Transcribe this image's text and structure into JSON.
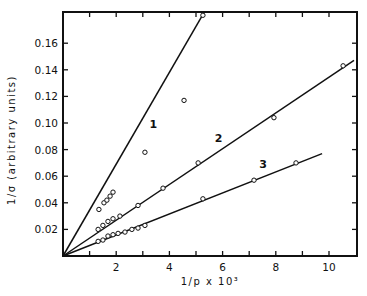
{
  "chart_data": {
    "type": "line",
    "title": "",
    "xlabel": "1/p x 10³",
    "ylabel": "1/σ  (arbitrary units)",
    "xlim": [
      0,
      11.1
    ],
    "ylim": [
      0,
      0.183
    ],
    "xticks": [
      1,
      2,
      3,
      4,
      5,
      6,
      7,
      8,
      9,
      10
    ],
    "xtick_labels": [
      "2",
      "4",
      "6",
      "8",
      "10"
    ],
    "yticks": [
      0.02,
      0.04,
      0.06,
      0.08,
      0.1,
      0.12,
      0.14,
      0.16
    ],
    "ytick_labels": [
      "0.02",
      "0.04",
      "0.06",
      "0.08",
      "0.10",
      "0.12",
      "0.14",
      "0.16"
    ],
    "grid": false,
    "legend": "none; curves labeled inline 1, 2, 3",
    "series": [
      {
        "name": "1",
        "fit_line": {
          "x": [
            0,
            5.3
          ],
          "y": [
            0,
            0.183
          ]
        },
        "points": [
          {
            "x": 1.35,
            "y": 0.035
          },
          {
            "x": 1.54,
            "y": 0.04
          },
          {
            "x": 1.65,
            "y": 0.042
          },
          {
            "x": 1.77,
            "y": 0.045
          },
          {
            "x": 1.88,
            "y": 0.048
          },
          {
            "x": 3.08,
            "y": 0.078
          },
          {
            "x": 4.55,
            "y": 0.117
          },
          {
            "x": 5.26,
            "y": 0.181
          }
        ],
        "label_pos": {
          "x": 3.4,
          "y": 0.096
        }
      },
      {
        "name": "2",
        "fit_line": {
          "x": [
            0,
            10.94
          ],
          "y": [
            0,
            0.147
          ]
        },
        "points": [
          {
            "x": 1.32,
            "y": 0.02
          },
          {
            "x": 1.5,
            "y": 0.023
          },
          {
            "x": 1.69,
            "y": 0.026
          },
          {
            "x": 1.88,
            "y": 0.028
          },
          {
            "x": 2.14,
            "y": 0.03
          },
          {
            "x": 2.82,
            "y": 0.038
          },
          {
            "x": 3.76,
            "y": 0.051
          },
          {
            "x": 5.08,
            "y": 0.07
          },
          {
            "x": 7.93,
            "y": 0.104
          },
          {
            "x": 10.53,
            "y": 0.143
          }
        ],
        "label_pos": {
          "x": 5.85,
          "y": 0.086
        }
      },
      {
        "name": "3",
        "fit_line": {
          "x": [
            0,
            9.74
          ],
          "y": [
            0,
            0.077
          ]
        },
        "points": [
          {
            "x": 1.32,
            "y": 0.011
          },
          {
            "x": 1.5,
            "y": 0.012
          },
          {
            "x": 1.69,
            "y": 0.015
          },
          {
            "x": 1.88,
            "y": 0.016
          },
          {
            "x": 2.07,
            "y": 0.017
          },
          {
            "x": 2.33,
            "y": 0.018
          },
          {
            "x": 2.59,
            "y": 0.02
          },
          {
            "x": 2.82,
            "y": 0.021
          },
          {
            "x": 3.08,
            "y": 0.023
          },
          {
            "x": 5.26,
            "y": 0.043
          },
          {
            "x": 7.18,
            "y": 0.057
          },
          {
            "x": 8.76,
            "y": 0.07
          }
        ],
        "label_pos": {
          "x": 7.52,
          "y": 0.066
        }
      }
    ]
  },
  "layout": {
    "plot_px": {
      "left": 63,
      "top": 12,
      "right": 357,
      "bottom": 256
    },
    "x_px_per_unit": 26.6,
    "y_px_per_unit": 1330
  }
}
